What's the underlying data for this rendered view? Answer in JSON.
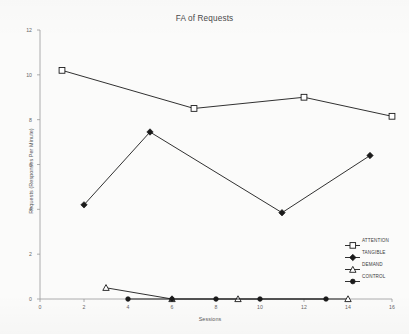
{
  "chart_data": {
    "type": "line",
    "title": "FA of Requests",
    "xlabel": "Sessions",
    "ylabel": "Requests (Responses Per Minute)",
    "xlim": [
      0,
      16
    ],
    "ylim": [
      0,
      12
    ],
    "xticks": [
      "0",
      "2",
      "4",
      "6",
      "8",
      "10",
      "12",
      "14",
      "16"
    ],
    "yticks": [
      "0",
      "2",
      "4",
      "6",
      "8",
      "10",
      "12"
    ],
    "grid": false,
    "legend_position": "right-middle",
    "series": [
      {
        "name": "ATTENTION",
        "marker": "square-open",
        "color": "#1a1a1a",
        "x": [
          1,
          7,
          12,
          16
        ],
        "y": [
          10.2,
          8.5,
          9.0,
          8.15
        ]
      },
      {
        "name": "TANGIBLE",
        "marker": "diamond-filled",
        "color": "#1a1a1a",
        "x": [
          2,
          5,
          11,
          15
        ],
        "y": [
          4.2,
          7.45,
          3.85,
          6.4
        ]
      },
      {
        "name": "DEMAND",
        "marker": "triangle-open",
        "color": "#1a1a1a",
        "x": [
          3,
          6,
          9,
          14
        ],
        "y": [
          0.5,
          0.0,
          0.0,
          0.0
        ]
      },
      {
        "name": "CONTROL",
        "marker": "circle-filled",
        "color": "#1a1a1a",
        "x": [
          4,
          6,
          8,
          10,
          13
        ],
        "y": [
          0.0,
          0.0,
          0.0,
          0.0,
          0.0
        ]
      }
    ]
  }
}
